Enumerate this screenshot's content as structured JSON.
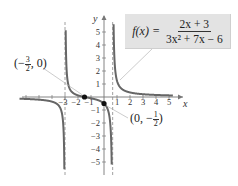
{
  "formula": {
    "lhs": "f(x) =",
    "numerator": "2x + 3",
    "denominator": "3x² + 7x − 6"
  },
  "points": [
    {
      "label_prefix": "(−",
      "frac_num": "3",
      "frac_den": "2",
      "label_suffix": ", 0)",
      "x": -1.5,
      "y": 0
    },
    {
      "label_prefix": "(0, −",
      "frac_num": "1",
      "frac_den": "2",
      "label_suffix": ")",
      "x": 0,
      "y": -0.5
    }
  ],
  "axes": {
    "x_label": "x",
    "y_label": "y",
    "x_ticks": [
      "−3",
      "−2",
      "−1",
      "1",
      "2",
      "3",
      "4",
      "5"
    ],
    "y_ticks": [
      "5",
      "4",
      "3",
      "2",
      "1",
      "−1",
      "−2",
      "−3",
      "−4",
      "−5"
    ]
  },
  "chart_data": {
    "type": "line",
    "xlabel": "x",
    "ylabel": "y",
    "xlim": [
      -5.5,
      5.5
    ],
    "ylim": [
      -6,
      6
    ],
    "grid": false,
    "vertical_asymptotes": [
      -3,
      0.6667
    ],
    "horizontal_asymptote": 0,
    "intercepts": [
      {
        "label": "(−3/2, 0)",
        "x": -1.5,
        "y": 0
      },
      {
        "label": "(0, −1/2)",
        "x": 0,
        "y": -0.5
      }
    ],
    "x_ticks": [
      -3,
      -2,
      -1,
      1,
      2,
      3,
      4,
      5
    ],
    "y_ticks": [
      -5,
      -4,
      -3,
      -2,
      -1,
      1,
      2,
      3,
      4,
      5
    ],
    "series": [
      {
        "name": "f(x)",
        "function": "(2x+3)/(3x^2+7x-6)"
      }
    ]
  }
}
